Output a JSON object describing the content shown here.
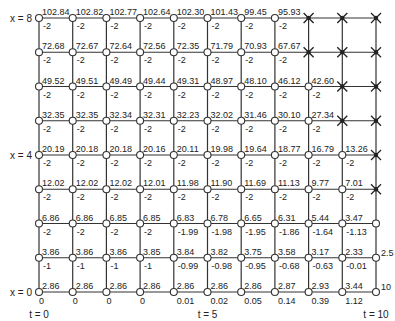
{
  "diagram": {
    "row_labels": [
      {
        "row": 8,
        "text": "x = 8"
      },
      {
        "row": 4,
        "text": "x = 4"
      },
      {
        "row": 0,
        "text": "x = 0"
      }
    ],
    "col_labels": [
      {
        "col": 0,
        "text": "t = 0"
      },
      {
        "col": 5,
        "text": "t = 5"
      },
      {
        "col": 10,
        "text": "t = 10"
      }
    ],
    "right_labels": [
      {
        "row": 1,
        "text": "2.5"
      },
      {
        "row": 0,
        "text": "10"
      }
    ],
    "bottom_values": [
      "0",
      "0",
      "0",
      "0",
      "0.01",
      "0.02",
      "0.05",
      "0.14",
      "0.39",
      "1.12"
    ],
    "rows": [
      {
        "x": 8,
        "values": [
          "102.84",
          "102.82",
          "102.77",
          "102.64",
          "102.30",
          "101.43",
          "99.45",
          "95.93"
        ],
        "slopes": [
          "-2",
          "-2",
          "-2",
          "-2",
          "-2",
          "-2",
          "-2",
          "-2"
        ],
        "crossed_from": 8
      },
      {
        "x": 7,
        "values": [
          "72.68",
          "72.67",
          "72.64",
          "72.56",
          "72.35",
          "71.79",
          "70.93",
          "67.67"
        ],
        "slopes": [
          "-2",
          "-2",
          "-2",
          "-2",
          "-2",
          "-2",
          "-2",
          "-2"
        ],
        "crossed_from": 8
      },
      {
        "x": 6,
        "values": [
          "49.52",
          "49.51",
          "49.49",
          "49.44",
          "49.31",
          "48.97",
          "48.10",
          "46.12",
          "42.60"
        ],
        "slopes": [
          "-2",
          "-2",
          "-2",
          "-2",
          "-2",
          "-2",
          "-2",
          "-2",
          "-2"
        ],
        "crossed_from": 9
      },
      {
        "x": 5,
        "values": [
          "32.35",
          "32.35",
          "32.34",
          "32.31",
          "32.23",
          "32.02",
          "31.46",
          "30.10",
          "27.34"
        ],
        "slopes": [
          "-2",
          "-2",
          "-2",
          "-2",
          "-2",
          "-2",
          "-2",
          "-2",
          "-2"
        ],
        "crossed_from": 9
      },
      {
        "x": 4,
        "values": [
          "20.19",
          "20.18",
          "20.18",
          "20.16",
          "20.11",
          "19.98",
          "19.64",
          "18.77",
          "16.79",
          "13.26"
        ],
        "slopes": [
          "-2",
          "-2",
          "-2",
          "-2",
          "-2",
          "-2",
          "-2",
          "-2",
          "-2",
          "-2"
        ],
        "crossed_from": 10
      },
      {
        "x": 3,
        "values": [
          "12.02",
          "12.02",
          "12.02",
          "12.01",
          "11.98",
          "11.90",
          "11.69",
          "11.13",
          "9.77",
          "7.01"
        ],
        "slopes": [
          "-2",
          "-2",
          "-2",
          "-2",
          "-2",
          "-2",
          "-2",
          "-2",
          "-2",
          "-2"
        ],
        "crossed_from": 10
      },
      {
        "x": 2,
        "values": [
          "6.86",
          "6.86",
          "6.85",
          "6.85",
          "6.83",
          "6.78",
          "6.65",
          "6.31",
          "5.44",
          "3.47"
        ],
        "slopes": [
          "-2",
          "-2",
          "-2",
          "-2",
          "-1.99",
          "-1.98",
          "-1.95",
          "-1.86",
          "-1.64",
          "-1.13"
        ],
        "crossed_from": 11
      },
      {
        "x": 1,
        "values": [
          "3.86",
          "3.86",
          "3.86",
          "3.85",
          "3.84",
          "3.82",
          "3.75",
          "3.58",
          "3.17",
          "2.33"
        ],
        "slopes": [
          "-1",
          "-1",
          "-1",
          "-1",
          "-0.99",
          "-0.98",
          "-0.95",
          "-0.68",
          "-0.63",
          "-0.01"
        ],
        "crossed_from": 11
      },
      {
        "x": 0,
        "values": [
          "2.86",
          "2.86",
          "2.86",
          "2.86",
          "2.86",
          "2.86",
          "2.86",
          "2.87",
          "2.93",
          "3.44"
        ],
        "slopes": [],
        "crossed_from": 11
      }
    ]
  }
}
